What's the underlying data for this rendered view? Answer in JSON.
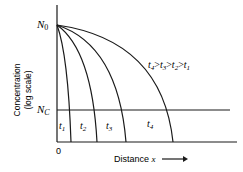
{
  "diagram": {
    "y_axis_label_line1": "Concentration",
    "y_axis_label_line2": "(log scale)",
    "x_axis_label": "Distance x",
    "origin_label": "0",
    "n0_label": "N",
    "n0_sub": "0",
    "nc_label": "N",
    "nc_sub": "C",
    "inequality": "t4 > t3 > t2 > t1",
    "curves": [
      {
        "label": "t",
        "sub": "1"
      },
      {
        "label": "t",
        "sub": "2"
      },
      {
        "label": "t",
        "sub": "3"
      },
      {
        "label": "t",
        "sub": "4"
      }
    ]
  }
}
